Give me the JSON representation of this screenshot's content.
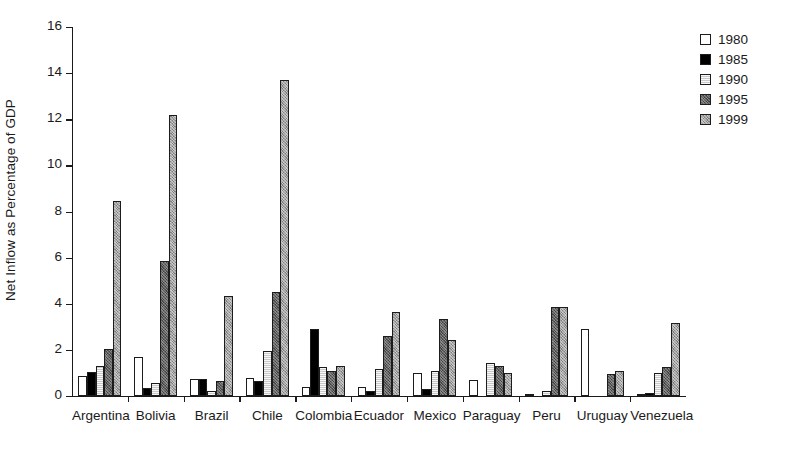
{
  "chart_data": {
    "type": "bar",
    "title": "",
    "xlabel": "",
    "ylabel": "Net Inflow as Percentage of GDP",
    "ylim": [
      0,
      16
    ],
    "ytick_step": 2,
    "ytick_labels": [
      "0",
      "2",
      "4",
      "6",
      "8",
      "10",
      "12",
      "14",
      "16"
    ],
    "grid": false,
    "legend_position": "top-right",
    "categories": [
      "Argentina",
      "Bolivia",
      "Brazil",
      "Chile",
      "Colombia",
      "Ecuador",
      "Mexico",
      "Paraguay",
      "Peru",
      "Uruguay",
      "Venezuela"
    ],
    "series": [
      {
        "name": "1980",
        "color": "#ffffff",
        "fill_class": "fill-1980",
        "values": [
          0.85,
          1.7,
          0.75,
          0.8,
          0.4,
          0.4,
          1.0,
          0.7,
          0.05,
          2.9,
          0.05
        ]
      },
      {
        "name": "1985",
        "color": "#000000",
        "fill_class": "fill-1985",
        "values": [
          1.05,
          0.35,
          0.75,
          0.65,
          2.9,
          0.2,
          0.3,
          0.0,
          0.0,
          0.0,
          0.15
        ]
      },
      {
        "name": "1990",
        "color": "#c9c9c9",
        "fill_class": "fill-1990",
        "values": [
          1.3,
          0.55,
          0.2,
          1.95,
          1.25,
          1.15,
          1.1,
          1.45,
          0.2,
          0.0,
          1.0
        ]
      },
      {
        "name": "1995",
        "color": "#5e5e5e",
        "fill_class": "fill-1995",
        "values": [
          2.05,
          5.85,
          0.65,
          4.5,
          1.1,
          2.6,
          3.35,
          1.3,
          3.85,
          0.95,
          1.25
        ]
      },
      {
        "name": "1999",
        "color": "#a2a2a2",
        "fill_class": "fill-1999",
        "values": [
          8.45,
          12.2,
          4.35,
          13.7,
          1.3,
          3.65,
          2.45,
          1.0,
          3.85,
          1.1,
          3.15
        ]
      }
    ]
  },
  "legend": {
    "items": [
      {
        "label": "1980"
      },
      {
        "label": "1985"
      },
      {
        "label": "1990"
      },
      {
        "label": "1995"
      },
      {
        "label": "1999"
      }
    ]
  }
}
